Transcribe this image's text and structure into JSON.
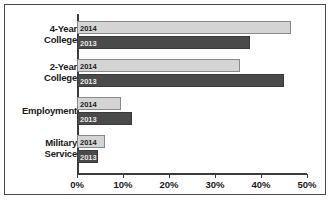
{
  "chart_data": {
    "type": "bar",
    "orientation": "horizontal",
    "title": "",
    "xlabel": "",
    "ylabel": "",
    "categories": [
      "4-Year College",
      "2-Year College",
      "Employment",
      "Military Service"
    ],
    "series": [
      {
        "name": "2014",
        "values": [
          46.5,
          35.5,
          9.5,
          6.0
        ],
        "color": "#d4d4d4"
      },
      {
        "name": "2013",
        "values": [
          37.5,
          45.0,
          12.0,
          4.5
        ],
        "color": "#4a4a4a"
      }
    ],
    "xlim": [
      0,
      50
    ],
    "xticks": [
      0,
      10,
      20,
      30,
      40,
      50
    ],
    "xtick_labels": [
      "0%",
      "10%",
      "20%",
      "30%",
      "40%",
      "50%"
    ],
    "grid": false,
    "legend": "in-bar-labels"
  },
  "axis": {
    "ticks": [
      {
        "label": "0%",
        "value": 0
      },
      {
        "label": "10%",
        "value": 10
      },
      {
        "label": "20%",
        "value": 20
      },
      {
        "label": "30%",
        "value": 30
      },
      {
        "label": "40%",
        "value": 40
      },
      {
        "label": "50%",
        "value": 50
      }
    ]
  },
  "categories": [
    {
      "line1": "4-Year",
      "line2": "College"
    },
    {
      "line1": "2-Year",
      "line2": "College"
    },
    {
      "line1": "Employment",
      "line2": ""
    },
    {
      "line1": "Military",
      "line2": "Service"
    }
  ],
  "bar_labels": {
    "s2014": "2014",
    "s2013": "2013"
  }
}
